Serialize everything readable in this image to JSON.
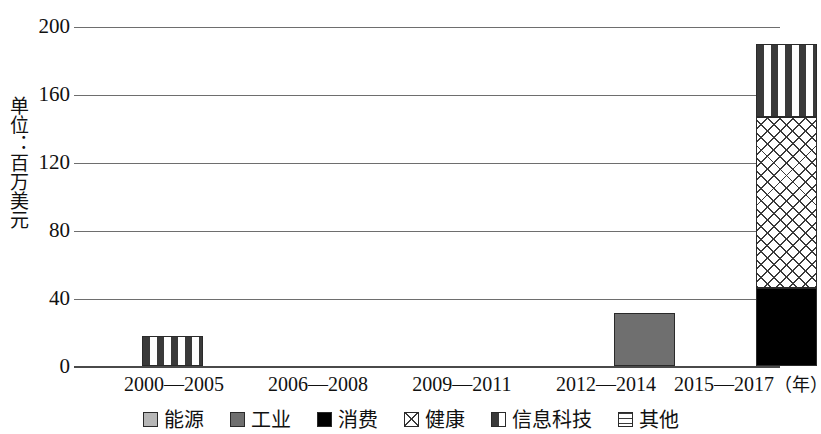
{
  "chart_data": {
    "type": "bar",
    "stacked": true,
    "title": "",
    "xlabel": "年",
    "ylabel": "单位：百万美元",
    "categories": [
      "2000—2005",
      "2006—2008",
      "2009—2011",
      "2012—2014",
      "2015—2017"
    ],
    "yticks": [
      0,
      40,
      80,
      120,
      160,
      200
    ],
    "ylim": [
      0,
      200
    ],
    "grid": true,
    "legend_position": "bottom",
    "series": [
      {
        "name": "能源",
        "key": "energy",
        "pattern": "solid-light-gray",
        "color": "#b7b7b7",
        "values": [
          0,
          0,
          0,
          0,
          0
        ]
      },
      {
        "name": "工业",
        "key": "industry",
        "pattern": "solid-dark-gray",
        "color": "#6f6f6f",
        "values": [
          0,
          0,
          0,
          31,
          0
        ]
      },
      {
        "name": "消费",
        "key": "consumer",
        "pattern": "solid-black",
        "color": "#000000",
        "values": [
          0,
          0,
          0,
          0,
          46
        ]
      },
      {
        "name": "健康",
        "key": "health",
        "pattern": "diagonal-crosshatch",
        "color": "#ffffff",
        "values": [
          0,
          0,
          0,
          0,
          101
        ]
      },
      {
        "name": "信息科技",
        "key": "it",
        "pattern": "dashed-dots",
        "color": "#ffffff",
        "values": [
          18,
          0,
          0,
          0,
          43
        ]
      },
      {
        "name": "其他",
        "key": "other",
        "pattern": "horizontal-lines",
        "color": "#ffffff",
        "values": [
          0,
          0,
          0,
          0,
          0
        ]
      }
    ],
    "totals": [
      18,
      0,
      0,
      31,
      190
    ]
  },
  "axis": {
    "y_unit_label": "单位：百万美元",
    "y_tick_labels": [
      "200",
      "160",
      "120",
      "80",
      "40",
      "0"
    ],
    "x_unit_suffix": "（年）"
  },
  "x_categories": [
    {
      "label": "2000—2005"
    },
    {
      "label": "2006—2008"
    },
    {
      "label": "2009—2011"
    },
    {
      "label": "2012—2014"
    },
    {
      "label": "2015—2017"
    }
  ],
  "legend": {
    "items": [
      {
        "label": "能源",
        "swatch": "solid-light-gray"
      },
      {
        "label": "工业",
        "swatch": "solid-dark-gray"
      },
      {
        "label": "消费",
        "swatch": "solid-black"
      },
      {
        "label": "健康",
        "swatch": "diagonal-crosshatch"
      },
      {
        "label": "信息科技",
        "swatch": "dashed-dots"
      },
      {
        "label": "其他",
        "swatch": "horizontal-lines"
      }
    ]
  }
}
